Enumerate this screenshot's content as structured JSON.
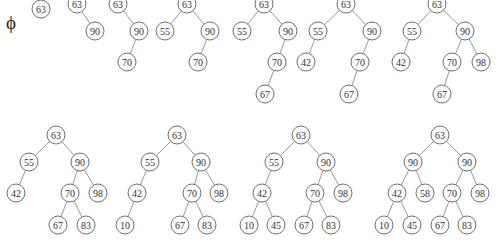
{
  "diagram": {
    "title": "",
    "type": "binary-tree-insertion-sequence",
    "node_radius": 9,
    "colors": {
      "node_stroke": "#6e6e6e",
      "edge_stroke": "#8a8a8a",
      "text": "#333333",
      "background": "#ffffff"
    },
    "empty_tree": {
      "label": "ϕ",
      "x": 11,
      "y": 22
    },
    "trees": [
      {
        "step": 1,
        "nodes": [
          {
            "id": "a",
            "label": "63",
            "x": 41,
            "y": 9
          }
        ],
        "edges": []
      },
      {
        "step": 2,
        "nodes": [
          {
            "id": "a",
            "label": "63",
            "x": 77,
            "y": 4
          },
          {
            "id": "b",
            "label": "90",
            "x": 95,
            "y": 31
          }
        ],
        "edges": [
          [
            "a",
            "b"
          ]
        ]
      },
      {
        "step": 3,
        "nodes": [
          {
            "id": "a",
            "label": "63",
            "x": 118,
            "y": 4
          },
          {
            "id": "b",
            "label": "90",
            "x": 139,
            "y": 31
          },
          {
            "id": "c",
            "label": "70",
            "x": 127,
            "y": 62
          }
        ],
        "edges": [
          [
            "a",
            "b"
          ],
          [
            "b",
            "c"
          ]
        ]
      },
      {
        "step": 4,
        "nodes": [
          {
            "id": "a",
            "label": "63",
            "x": 187,
            "y": 4
          },
          {
            "id": "b",
            "label": "55",
            "x": 165,
            "y": 31
          },
          {
            "id": "c",
            "label": "90",
            "x": 210,
            "y": 31
          },
          {
            "id": "d",
            "label": "70",
            "x": 198,
            "y": 62
          }
        ],
        "edges": [
          [
            "a",
            "b"
          ],
          [
            "a",
            "c"
          ],
          [
            "c",
            "d"
          ]
        ]
      },
      {
        "step": 5,
        "nodes": [
          {
            "id": "a",
            "label": "63",
            "x": 264,
            "y": 4
          },
          {
            "id": "b",
            "label": "55",
            "x": 242,
            "y": 31
          },
          {
            "id": "c",
            "label": "90",
            "x": 288,
            "y": 31
          },
          {
            "id": "d",
            "label": "70",
            "x": 277,
            "y": 62
          },
          {
            "id": "e",
            "label": "67",
            "x": 265,
            "y": 94
          }
        ],
        "edges": [
          [
            "a",
            "b"
          ],
          [
            "a",
            "c"
          ],
          [
            "c",
            "d"
          ],
          [
            "d",
            "e"
          ]
        ]
      },
      {
        "step": 6,
        "nodes": [
          {
            "id": "a",
            "label": "63",
            "x": 346,
            "y": 4
          },
          {
            "id": "b",
            "label": "55",
            "x": 318,
            "y": 31
          },
          {
            "id": "c",
            "label": "90",
            "x": 372,
            "y": 31
          },
          {
            "id": "d",
            "label": "42",
            "x": 306,
            "y": 62
          },
          {
            "id": "e",
            "label": "70",
            "x": 360,
            "y": 62
          },
          {
            "id": "f",
            "label": "67",
            "x": 349,
            "y": 94
          }
        ],
        "edges": [
          [
            "a",
            "b"
          ],
          [
            "a",
            "c"
          ],
          [
            "b",
            "d"
          ],
          [
            "c",
            "e"
          ],
          [
            "e",
            "f"
          ]
        ]
      },
      {
        "step": 7,
        "nodes": [
          {
            "id": "a",
            "label": "63",
            "x": 437,
            "y": 4
          },
          {
            "id": "b",
            "label": "55",
            "x": 412,
            "y": 31
          },
          {
            "id": "c",
            "label": "90",
            "x": 465,
            "y": 31
          },
          {
            "id": "d",
            "label": "42",
            "x": 401,
            "y": 62
          },
          {
            "id": "e",
            "label": "70",
            "x": 452,
            "y": 62
          },
          {
            "id": "f",
            "label": "98",
            "x": 481,
            "y": 62
          },
          {
            "id": "g",
            "label": "67",
            "x": 442,
            "y": 94
          }
        ],
        "edges": [
          [
            "a",
            "b"
          ],
          [
            "a",
            "c"
          ],
          [
            "b",
            "d"
          ],
          [
            "c",
            "e"
          ],
          [
            "c",
            "f"
          ],
          [
            "e",
            "g"
          ]
        ]
      },
      {
        "step": 8,
        "nodes": [
          {
            "id": "a",
            "label": "63",
            "x": 56,
            "y": 135
          },
          {
            "id": "b",
            "label": "55",
            "x": 29,
            "y": 162
          },
          {
            "id": "c",
            "label": "90",
            "x": 80,
            "y": 162
          },
          {
            "id": "d",
            "label": "42",
            "x": 16,
            "y": 193
          },
          {
            "id": "e",
            "label": "70",
            "x": 70,
            "y": 193
          },
          {
            "id": "f",
            "label": "98",
            "x": 98,
            "y": 193
          },
          {
            "id": "g",
            "label": "67",
            "x": 58,
            "y": 225
          },
          {
            "id": "h",
            "label": "83",
            "x": 86,
            "y": 225
          }
        ],
        "edges": [
          [
            "a",
            "b"
          ],
          [
            "a",
            "c"
          ],
          [
            "b",
            "d"
          ],
          [
            "c",
            "e"
          ],
          [
            "c",
            "f"
          ],
          [
            "e",
            "g"
          ],
          [
            "e",
            "h"
          ]
        ]
      },
      {
        "step": 9,
        "nodes": [
          {
            "id": "a",
            "label": "63",
            "x": 177,
            "y": 135
          },
          {
            "id": "b",
            "label": "55",
            "x": 150,
            "y": 162
          },
          {
            "id": "c",
            "label": "90",
            "x": 201,
            "y": 162
          },
          {
            "id": "d",
            "label": "42",
            "x": 137,
            "y": 193
          },
          {
            "id": "e",
            "label": "70",
            "x": 192,
            "y": 193
          },
          {
            "id": "f",
            "label": "98",
            "x": 219,
            "y": 193
          },
          {
            "id": "g",
            "label": "10",
            "x": 125,
            "y": 225
          },
          {
            "id": "h",
            "label": "67",
            "x": 180,
            "y": 225
          },
          {
            "id": "i",
            "label": "83",
            "x": 207,
            "y": 225
          }
        ],
        "edges": [
          [
            "a",
            "b"
          ],
          [
            "a",
            "c"
          ],
          [
            "b",
            "d"
          ],
          [
            "c",
            "e"
          ],
          [
            "c",
            "f"
          ],
          [
            "d",
            "g"
          ],
          [
            "e",
            "h"
          ],
          [
            "e",
            "i"
          ]
        ]
      },
      {
        "step": 10,
        "nodes": [
          {
            "id": "a",
            "label": "63",
            "x": 301,
            "y": 135
          },
          {
            "id": "b",
            "label": "55",
            "x": 274,
            "y": 162
          },
          {
            "id": "c",
            "label": "90",
            "x": 326,
            "y": 162
          },
          {
            "id": "d",
            "label": "42",
            "x": 262,
            "y": 193
          },
          {
            "id": "e",
            "label": "70",
            "x": 315,
            "y": 193
          },
          {
            "id": "f",
            "label": "98",
            "x": 343,
            "y": 193
          },
          {
            "id": "g",
            "label": "10",
            "x": 249,
            "y": 225
          },
          {
            "id": "h",
            "label": "45",
            "x": 276,
            "y": 225
          },
          {
            "id": "i",
            "label": "67",
            "x": 304,
            "y": 225
          },
          {
            "id": "j",
            "label": "83",
            "x": 331,
            "y": 225
          }
        ],
        "edges": [
          [
            "a",
            "b"
          ],
          [
            "a",
            "c"
          ],
          [
            "b",
            "d"
          ],
          [
            "c",
            "e"
          ],
          [
            "c",
            "f"
          ],
          [
            "d",
            "g"
          ],
          [
            "d",
            "h"
          ],
          [
            "e",
            "i"
          ],
          [
            "e",
            "j"
          ]
        ]
      },
      {
        "step": 11,
        "nodes": [
          {
            "id": "a",
            "label": "63",
            "x": 440,
            "y": 135
          },
          {
            "id": "b",
            "label": "90",
            "x": 413,
            "y": 162
          },
          {
            "id": "c",
            "label": "90",
            "x": 467,
            "y": 162
          },
          {
            "id": "d",
            "label": "42",
            "x": 397,
            "y": 193
          },
          {
            "id": "e",
            "label": "58",
            "x": 425,
            "y": 193
          },
          {
            "id": "f",
            "label": "70",
            "x": 452,
            "y": 193
          },
          {
            "id": "g",
            "label": "98",
            "x": 480,
            "y": 193
          },
          {
            "id": "h",
            "label": "10",
            "x": 384,
            "y": 225
          },
          {
            "id": "i",
            "label": "45",
            "x": 412,
            "y": 225
          },
          {
            "id": "j",
            "label": "67",
            "x": 440,
            "y": 225
          },
          {
            "id": "k",
            "label": "83",
            "x": 467,
            "y": 225
          }
        ],
        "edges": [
          [
            "a",
            "b"
          ],
          [
            "a",
            "c"
          ],
          [
            "b",
            "d"
          ],
          [
            "b",
            "e"
          ],
          [
            "c",
            "f"
          ],
          [
            "c",
            "g"
          ],
          [
            "d",
            "h"
          ],
          [
            "d",
            "i"
          ],
          [
            "f",
            "j"
          ],
          [
            "f",
            "k"
          ]
        ]
      }
    ]
  }
}
